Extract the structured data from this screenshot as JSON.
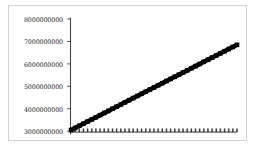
{
  "figure": {
    "background_color": "#ffffff",
    "frame_color": "#d2d2d2",
    "width": 257,
    "height": 150
  },
  "axis": {
    "spine_color": "#4a4a4a",
    "tick_labels": [
      "8000000000",
      "7000000000",
      "6000000000",
      "5000000000",
      "4000000000",
      "3000000000"
    ]
  },
  "chart_data": {
    "type": "line",
    "title": "",
    "subtitle": "",
    "xlabel": "",
    "ylabel": "",
    "xlim": [
      0,
      40
    ],
    "ylim": [
      3000000000,
      8000000000
    ],
    "grid": false,
    "legend": "none",
    "yticks": [
      3000000000,
      4000000000,
      5000000000,
      6000000000,
      7000000000,
      8000000000
    ],
    "ytick_labels": [
      "3000000000",
      "4000000000",
      "5000000000",
      "6000000000",
      "7000000000",
      "8000000000"
    ],
    "xticks": [],
    "xtick_labels": [],
    "x": [
      0,
      1,
      2,
      3,
      4,
      5,
      6,
      7,
      8,
      9,
      10,
      11,
      12,
      13,
      14,
      15,
      16,
      17,
      18,
      19,
      20,
      21,
      22,
      23,
      24,
      25,
      26,
      27,
      28,
      29,
      30,
      31,
      32,
      33,
      34,
      35,
      36,
      37,
      38,
      39,
      40
    ],
    "series": [
      {
        "name": "rising-series",
        "color": "#000000",
        "marker": "square",
        "linewidth": 4.5,
        "values": [
          3050000000,
          3145000000,
          3240000000,
          3335000000,
          3430000000,
          3525000000,
          3620000000,
          3715000000,
          3810000000,
          3905000000,
          4000000000,
          4095000000,
          4190000000,
          4285000000,
          4380000000,
          4475000000,
          4570000000,
          4665000000,
          4760000000,
          4855000000,
          4950000000,
          5045000000,
          5140000000,
          5235000000,
          5330000000,
          5425000000,
          5520000000,
          5615000000,
          5710000000,
          5805000000,
          5900000000,
          5995000000,
          6090000000,
          6185000000,
          6280000000,
          6375000000,
          6470000000,
          6565000000,
          6660000000,
          6755000000,
          6850000000
        ]
      },
      {
        "name": "flat-series",
        "color": "#3a3a3a",
        "marker": "tick",
        "linewidth": 1,
        "values": [
          3050000000,
          3050000000,
          3050000000,
          3050000000,
          3050000000,
          3050000000,
          3050000000,
          3050000000,
          3050000000,
          3050000000,
          3050000000,
          3050000000,
          3050000000,
          3050000000,
          3050000000,
          3050000000,
          3050000000,
          3050000000,
          3050000000,
          3050000000,
          3050000000,
          3050000000,
          3050000000,
          3050000000,
          3050000000,
          3050000000,
          3050000000,
          3050000000,
          3050000000,
          3050000000,
          3050000000,
          3050000000,
          3050000000,
          3050000000,
          3050000000,
          3050000000,
          3050000000,
          3050000000,
          3050000000,
          3050000000,
          3050000000
        ]
      }
    ]
  }
}
